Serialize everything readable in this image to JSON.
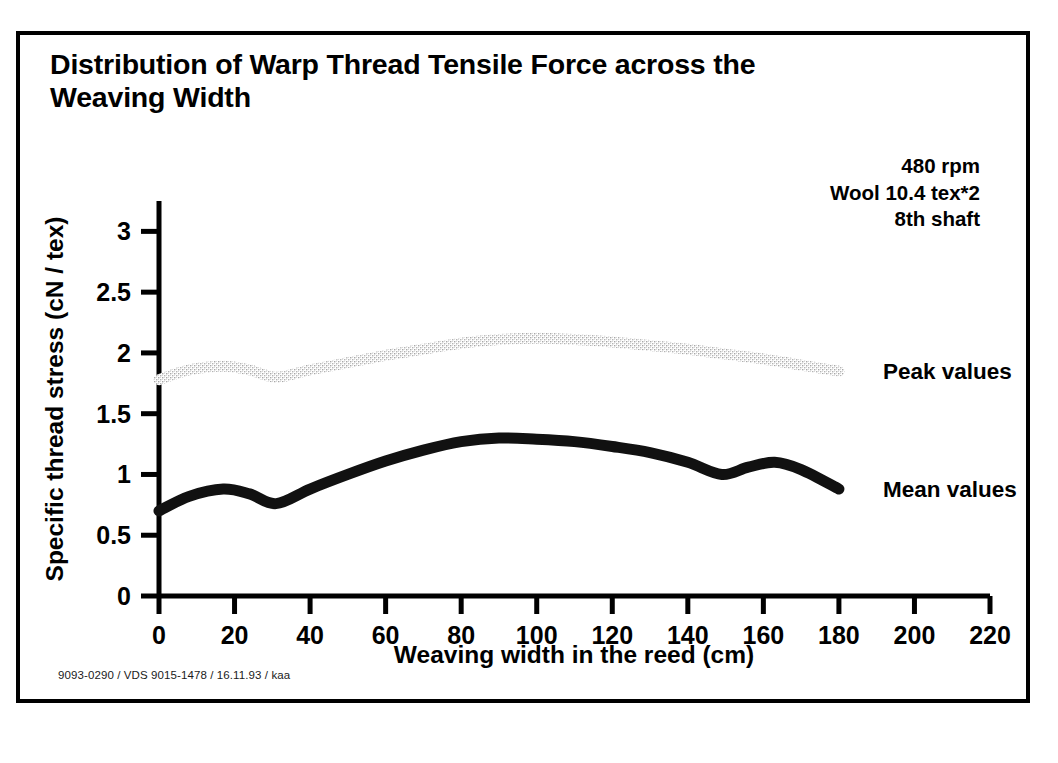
{
  "figure": {
    "title": "Distribution of Warp Thread Tensile Force across the\nWeaving Width",
    "conditions": [
      "480 rpm",
      "Wool 10.4 tex*2",
      "8th shaft"
    ],
    "footer": "9093-0290 / VDS 9015-1478 / 16.11.93 / kaa",
    "border_color": "#000000",
    "background_color": "#ffffff"
  },
  "chart_data": {
    "type": "line",
    "title": "Distribution of Warp Thread Tensile Force across the Weaving Width",
    "xlabel": "Weaving width in the reed (cm)",
    "ylabel": "Specific thread stress (cN / tex)",
    "xlim": [
      0,
      220
    ],
    "ylim": [
      0,
      3.25
    ],
    "xticks": [
      0,
      20,
      40,
      60,
      80,
      100,
      120,
      140,
      160,
      180,
      200,
      220
    ],
    "yticks": [
      0,
      0.5,
      1,
      1.5,
      2,
      2.5,
      3
    ],
    "xticklabels": [
      "0",
      "20",
      "40",
      "60",
      "80",
      "100",
      "120",
      "140",
      "160",
      "180",
      "200",
      "220"
    ],
    "yticklabels": [
      "0",
      "0.5",
      "1",
      "1.5",
      "2",
      "2.5",
      "3"
    ],
    "grid": false,
    "legend_position": "right-inline",
    "series": [
      {
        "name": "Peak values",
        "label": "Peak values",
        "color": "#c9c9c9",
        "style": "stippled-thick",
        "x": [
          0,
          8,
          17,
          24,
          31,
          40,
          50,
          60,
          70,
          80,
          90,
          100,
          110,
          120,
          130,
          140,
          150,
          160,
          170,
          180
        ],
        "values": [
          1.78,
          1.86,
          1.89,
          1.86,
          1.8,
          1.86,
          1.92,
          1.98,
          2.03,
          2.08,
          2.11,
          2.12,
          2.11,
          2.09,
          2.06,
          2.03,
          1.99,
          1.95,
          1.9,
          1.85
        ]
      },
      {
        "name": "Mean values",
        "label": "Mean values",
        "color": "#111111",
        "style": "solid-thick",
        "x": [
          0,
          8,
          17,
          24,
          31,
          40,
          50,
          60,
          70,
          80,
          90,
          100,
          110,
          120,
          130,
          140,
          149,
          156,
          163,
          170,
          180
        ],
        "values": [
          0.7,
          0.82,
          0.88,
          0.84,
          0.76,
          0.88,
          1.0,
          1.11,
          1.2,
          1.27,
          1.3,
          1.29,
          1.27,
          1.23,
          1.18,
          1.1,
          1.0,
          1.06,
          1.1,
          1.04,
          0.88
        ]
      }
    ]
  }
}
